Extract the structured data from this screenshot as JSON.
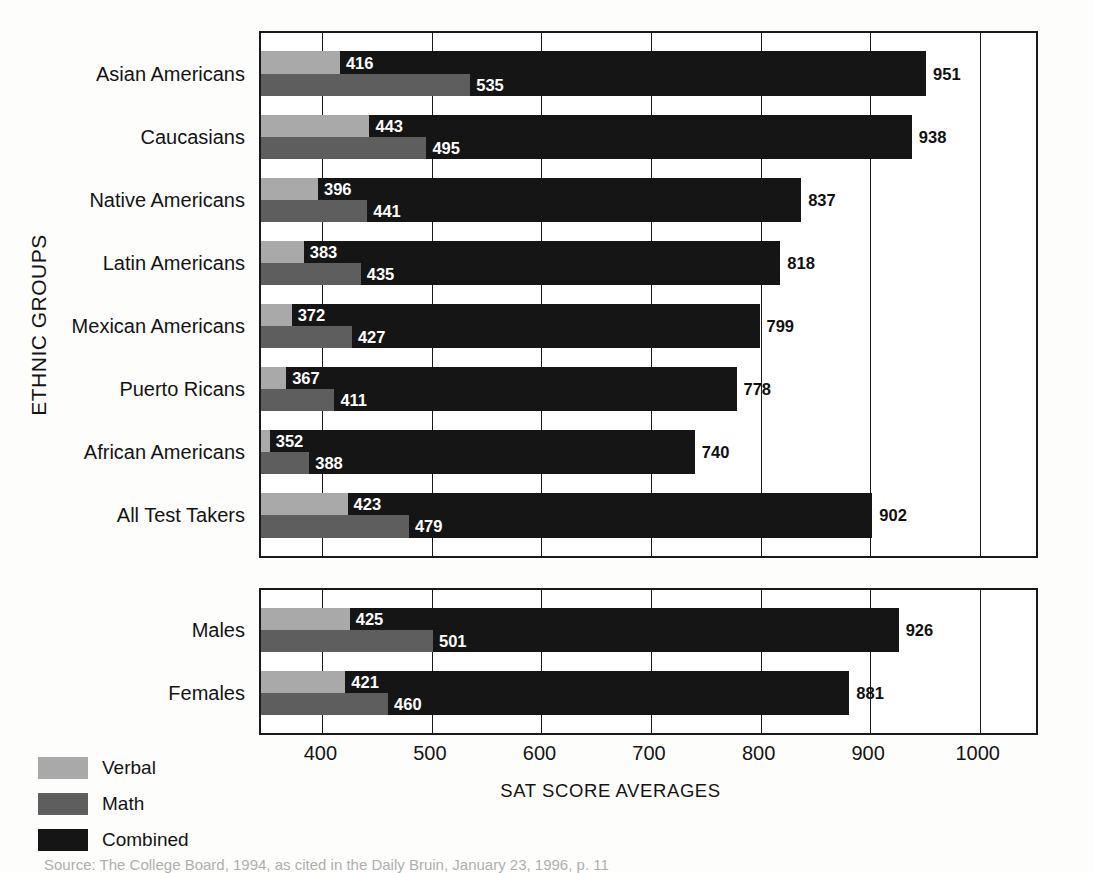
{
  "chart_data": {
    "type": "bar",
    "orientation": "horizontal",
    "title": "",
    "xlabel": "SAT SCORE AVERAGES",
    "ylabel": "ETHNIC GROUPS",
    "xlim": [
      344,
      1055
    ],
    "xticks": [
      400,
      500,
      600,
      700,
      800,
      900,
      1000
    ],
    "grid": true,
    "legend_position": "bottom-left",
    "series": [
      {
        "name": "Verbal",
        "color": "#a9a9a9"
      },
      {
        "name": "Math",
        "color": "#5e5e5e"
      },
      {
        "name": "Combined",
        "color": "#151515"
      }
    ],
    "panels": [
      {
        "name": "ethnic-groups",
        "categories": [
          "Asian Americans",
          "Caucasians",
          "Native Americans",
          "Latin Americans",
          "Mexican Americans",
          "Puerto Ricans",
          "African Americans",
          "All Test Takers"
        ],
        "verbal": [
          416,
          443,
          396,
          383,
          372,
          367,
          352,
          423
        ],
        "math": [
          535,
          495,
          441,
          435,
          427,
          411,
          388,
          479
        ],
        "combined": [
          951,
          938,
          837,
          818,
          799,
          778,
          740,
          902
        ]
      },
      {
        "name": "gender",
        "categories": [
          "Males",
          "Females"
        ],
        "verbal": [
          425,
          421
        ],
        "math": [
          501,
          460
        ],
        "combined": [
          926,
          881
        ]
      }
    ]
  },
  "axis": {
    "y_title": "ETHNIC GROUPS",
    "x_title": "SAT SCORE AVERAGES",
    "tick_labels": [
      "400",
      "500",
      "600",
      "700",
      "800",
      "900",
      "1000"
    ]
  },
  "legend": {
    "items": [
      {
        "label": "Verbal",
        "color": "#a9a9a9"
      },
      {
        "label": "Math",
        "color": "#5e5e5e"
      },
      {
        "label": "Combined",
        "color": "#151515"
      }
    ]
  },
  "source": {
    "text": "Source: The College Board, 1994, as cited in the Daily Bruin, January 23, 1996, p. 11"
  }
}
